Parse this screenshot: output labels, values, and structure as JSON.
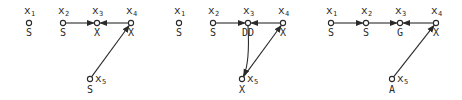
{
  "diagram": {
    "panels": [
      {
        "nodes": [
          {
            "id": "x1",
            "var": "x",
            "sub": "1",
            "state": "S"
          },
          {
            "id": "x2",
            "var": "x",
            "sub": "2",
            "state": "S"
          },
          {
            "id": "x3",
            "var": "x",
            "sub": "3",
            "state": "X"
          },
          {
            "id": "x4",
            "var": "x",
            "sub": "4",
            "state": "X"
          },
          {
            "id": "x5",
            "var": "x",
            "sub": "5",
            "state": "S"
          }
        ],
        "edges": [
          {
            "from": "x2",
            "to": "x3",
            "curve": false
          },
          {
            "from": "x4",
            "to": "x3",
            "curve": false
          },
          {
            "from": "x5",
            "to": "x4",
            "curve": false
          }
        ]
      },
      {
        "nodes": [
          {
            "id": "x1",
            "var": "x",
            "sub": "1",
            "state": "S"
          },
          {
            "id": "x2",
            "var": "x",
            "sub": "2",
            "state": "S"
          },
          {
            "id": "x3",
            "var": "x",
            "sub": "3",
            "state": "DD"
          },
          {
            "id": "x4",
            "var": "x",
            "sub": "4",
            "state": "X"
          },
          {
            "id": "x5",
            "var": "x",
            "sub": "5",
            "state": "X"
          }
        ],
        "edges": [
          {
            "from": "x2",
            "to": "x3",
            "curve": false
          },
          {
            "from": "x4",
            "to": "x3",
            "curve": false
          },
          {
            "from": "x3",
            "to": "x5",
            "curve": true
          },
          {
            "from": "x5",
            "to": "x4",
            "curve": false
          }
        ]
      },
      {
        "nodes": [
          {
            "id": "x1",
            "var": "x",
            "sub": "1",
            "state": "S"
          },
          {
            "id": "x2",
            "var": "x",
            "sub": "2",
            "state": "S"
          },
          {
            "id": "x3",
            "var": "x",
            "sub": "3",
            "state": "G"
          },
          {
            "id": "x4",
            "var": "x",
            "sub": "4",
            "state": "X"
          },
          {
            "id": "x5",
            "var": "x",
            "sub": "5",
            "state": "A"
          }
        ],
        "edges": [
          {
            "from": "x1",
            "to": "x2",
            "curve": false
          },
          {
            "from": "x2",
            "to": "x3",
            "curve": false
          },
          {
            "from": "x4",
            "to": "x3",
            "curve": false
          },
          {
            "from": "x5",
            "to": "x4",
            "curve": false
          }
        ]
      }
    ]
  }
}
